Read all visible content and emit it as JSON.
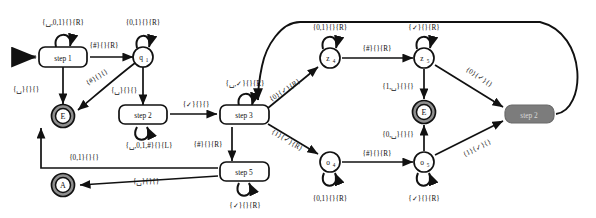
{
  "diagram": {
    "kind": "turing-machine-state-diagram",
    "background": "#ffffff",
    "stroke": "#111111",
    "halt_node_fill": "#7c7c7c",
    "halt_node_text": "#d8d8d8",
    "accept_ring_fill": "#9a9a9a",
    "symbols": {
      "blank": "␣",
      "check": "✓",
      "hash": "#",
      "zero": "0",
      "one": "1"
    }
  },
  "nodes": [
    {
      "id": "start_arrow",
      "name": "start-arrow",
      "label": "",
      "type": "start-marker",
      "x": 28,
      "y": 57
    },
    {
      "id": "step1",
      "name": "node-step-1",
      "label": "step 1",
      "type": "box",
      "x": 63,
      "y": 57
    },
    {
      "id": "q1",
      "name": "node-q1",
      "label": "q",
      "sub": "1",
      "type": "circle",
      "x": 143,
      "y": 57
    },
    {
      "id": "E1",
      "name": "node-e-left",
      "label": "E",
      "type": "double-circle",
      "x": 63,
      "y": 116
    },
    {
      "id": "step2",
      "name": "node-step-2",
      "label": "step 2",
      "type": "box",
      "x": 143,
      "y": 116
    },
    {
      "id": "step3",
      "name": "node-step-3",
      "label": "step 3",
      "type": "box",
      "x": 245,
      "y": 116
    },
    {
      "id": "step5",
      "name": "node-step-5",
      "label": "step 5",
      "type": "box",
      "x": 245,
      "y": 172
    },
    {
      "id": "A",
      "name": "node-a-accept",
      "label": "A",
      "type": "double-circle",
      "x": 63,
      "y": 185
    },
    {
      "id": "z4",
      "name": "node-z4",
      "label": "z",
      "sub": "4",
      "type": "circle",
      "x": 330,
      "y": 58
    },
    {
      "id": "o4",
      "name": "node-o4",
      "label": "o",
      "sub": "4",
      "type": "circle",
      "x": 330,
      "y": 162
    },
    {
      "id": "z5",
      "name": "node-z5",
      "label": "z",
      "sub": "5",
      "type": "circle",
      "x": 424,
      "y": 58
    },
    {
      "id": "o5",
      "name": "node-o5",
      "label": "o",
      "sub": "5",
      "type": "circle",
      "x": 424,
      "y": 162
    },
    {
      "id": "E2",
      "name": "node-e-right",
      "label": "E",
      "type": "double-circle",
      "x": 424,
      "y": 112
    },
    {
      "id": "halt",
      "name": "node-step-2-halt",
      "label": "step 2",
      "type": "box-filled",
      "x": 529,
      "y": 114
    }
  ],
  "edges": [
    {
      "name": "edge-step1-self",
      "from": "step1",
      "to": "step1",
      "label": "{␣,0,1}{}{R}",
      "lx": 63,
      "ly": 25
    },
    {
      "name": "edge-step1-q1",
      "from": "step1",
      "to": "q1",
      "label": "{#}{}{R}",
      "lx": 104,
      "ly": 48
    },
    {
      "name": "edge-step1-e",
      "from": "step1",
      "to": "E1",
      "label": "{␣}{}{}",
      "lx": 26,
      "ly": 90
    },
    {
      "name": "edge-q1-self",
      "from": "q1",
      "to": "q1",
      "label": "{0,1}{}{R}",
      "lx": 143,
      "ly": 25
    },
    {
      "name": "edge-q1-e",
      "from": "q1",
      "to": "E1",
      "label": "{#}{}{}",
      "lx": 98,
      "ly": 79,
      "rotate": -32
    },
    {
      "name": "edge-q1-step2",
      "from": "q1",
      "to": "step2",
      "label": "{␣}{}{}",
      "lx": 125,
      "ly": 92
    },
    {
      "name": "edge-step2-self",
      "from": "step2",
      "to": "step2",
      "label": "{␣,0,1,#}{}{L}",
      "lx": 147,
      "ly": 146
    },
    {
      "name": "edge-step2-step3",
      "from": "step2",
      "to": "step3",
      "label": "{✓}{}{}",
      "lx": 196,
      "ly": 107
    },
    {
      "name": "edge-step3-self",
      "from": "step3",
      "to": "step3",
      "label": "{␣,✓}{}{R}",
      "lx": 245,
      "ly": 84
    },
    {
      "name": "edge-step3-step5",
      "from": "step3",
      "to": "step5",
      "label": "{#}{}{R}",
      "lx": 212,
      "ly": 147
    },
    {
      "name": "edge-step3-z4",
      "from": "step3",
      "to": "z4",
      "label": "{0}{✓}{R}",
      "lx": 283,
      "ly": 92,
      "rotate": -33
    },
    {
      "name": "edge-step3-o4",
      "from": "step3",
      "to": "o4",
      "label": "{1}{✓}{R}",
      "lx": 283,
      "ly": 139,
      "rotate": 31
    },
    {
      "name": "edge-step5-self",
      "from": "step5",
      "to": "step5",
      "label": "{✓}{}{R}",
      "lx": 245,
      "ly": 205
    },
    {
      "name": "edge-step5-e",
      "from": "step5",
      "to": "E1",
      "label": "{0,1}{}{}",
      "lx": 84,
      "ly": 158
    },
    {
      "name": "edge-step5-a",
      "from": "step5",
      "to": "A",
      "label": "{␣}{}{}",
      "lx": 146,
      "ly": 182
    },
    {
      "name": "edge-z4-self",
      "from": "z4",
      "to": "z4",
      "label": "{0,1}{}{R}",
      "lx": 330,
      "ly": 30
    },
    {
      "name": "edge-z4-z5",
      "from": "z4",
      "to": "z5",
      "label": "{#}{}{R}",
      "lx": 377,
      "ly": 50
    },
    {
      "name": "edge-o4-self",
      "from": "o4",
      "to": "o4",
      "label": "{0,1}{}{R}",
      "lx": 330,
      "ly": 196
    },
    {
      "name": "edge-o4-o5",
      "from": "o4",
      "to": "o5",
      "label": "{#}{}{R}",
      "lx": 377,
      "ly": 155
    },
    {
      "name": "edge-z5-self",
      "from": "z5",
      "to": "z5",
      "label": "{✓}{}{R}",
      "lx": 424,
      "ly": 30
    },
    {
      "name": "edge-z5-e",
      "from": "z5",
      "to": "E2",
      "label": "{1,␣}{}{}",
      "lx": 399,
      "ly": 88
    },
    {
      "name": "edge-o5-self",
      "from": "o5",
      "to": "o5",
      "label": "{✓}{}{R}",
      "lx": 424,
      "ly": 196
    },
    {
      "name": "edge-o5-e",
      "from": "o5",
      "to": "E2",
      "label": "{0,␣}{}{}",
      "lx": 399,
      "ly": 135
    },
    {
      "name": "edge-z5-halt",
      "from": "z5",
      "to": "halt",
      "label": "{0}{✓}{}",
      "lx": 478,
      "ly": 79,
      "rotate": 33
    },
    {
      "name": "edge-o5-halt",
      "from": "o5",
      "to": "halt",
      "label": "{1}{✓}{}",
      "lx": 478,
      "ly": 148,
      "rotate": -33
    },
    {
      "name": "edge-halt-step3-return",
      "from": "halt",
      "to": "step3",
      "label": "",
      "lx": 0,
      "ly": 0
    }
  ]
}
